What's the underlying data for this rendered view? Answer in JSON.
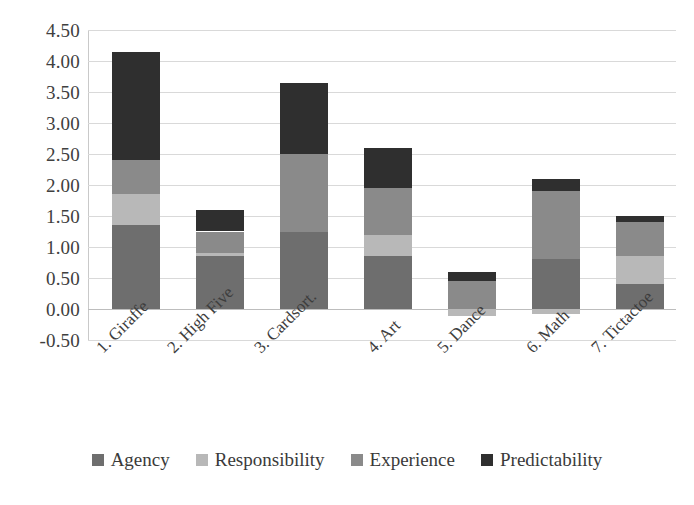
{
  "chart_data": {
    "type": "bar",
    "stacked": true,
    "title": "",
    "subtitle": "",
    "xlabel": "",
    "ylabel": "",
    "categories": [
      "1. Giraffe",
      "2. High Five",
      "3. Cardsort.",
      "4. Art",
      "5. Dance",
      "6. Math",
      "7. Tictactoe"
    ],
    "series": [
      {
        "name": "Agency",
        "color": "#6e6e6e",
        "values": [
          1.35,
          0.85,
          1.25,
          0.85,
          0.0,
          0.8,
          0.4
        ]
      },
      {
        "name": "Responsibility",
        "color": "#b8b8b8",
        "values": [
          0.5,
          0.05,
          0.0,
          0.35,
          -0.12,
          -0.08,
          0.45
        ]
      },
      {
        "name": "Experience",
        "color": "#8a8a8a",
        "values": [
          0.55,
          0.35,
          1.25,
          0.75,
          0.45,
          1.1,
          0.55
        ]
      },
      {
        "name": "Predictability",
        "color": "#2f2f2f",
        "values": [
          1.75,
          0.35,
          1.15,
          0.65,
          0.15,
          0.2,
          0.1
        ]
      }
    ],
    "totals": [
      4.15,
      1.55,
      3.65,
      2.6,
      0.6,
      2.1,
      1.5
    ],
    "ylim": [
      -0.5,
      4.5
    ],
    "ytick_labels": [
      "4.50",
      "4.00",
      "3.50",
      "3.00",
      "2.50",
      "2.00",
      "1.50",
      "1.00",
      "0.50",
      "0.00",
      "-0.50"
    ],
    "ytick_values": [
      4.5,
      4.0,
      3.5,
      3.0,
      2.5,
      2.0,
      1.5,
      1.0,
      0.5,
      0.0,
      -0.5
    ],
    "grid": true,
    "legend_position": "bottom"
  },
  "legend": {
    "items": [
      {
        "label": "Agency",
        "color": "#6e6e6e"
      },
      {
        "label": "Responsibility",
        "color": "#b8b8b8"
      },
      {
        "label": "Experience",
        "color": "#8a8a8a"
      },
      {
        "label": "Predictability",
        "color": "#2f2f2f"
      }
    ]
  }
}
